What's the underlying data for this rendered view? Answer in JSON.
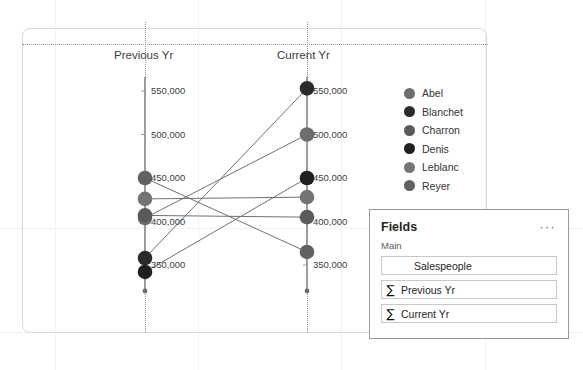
{
  "canvas": {
    "width": 583,
    "height": 370,
    "background": "#ffffff"
  },
  "visual": {
    "name": "line-chart-visual",
    "border_color": "#d9d9d9"
  },
  "chart_data": {
    "type": "line",
    "title": "",
    "xlabel": "",
    "ylabel": "",
    "categories": [
      "Previous Yr",
      "Current Yr"
    ],
    "ylim": [
      350000,
      550000
    ],
    "ytick_values": [
      350000,
      400000,
      450000,
      500000,
      550000
    ],
    "ytick_labels": [
      "350,000",
      "400,000",
      "450,000",
      "500,000",
      "550,000"
    ],
    "left_axis_tick_labels": [
      "550,000",
      "500,000",
      "450,000",
      "400,000",
      "350,000"
    ],
    "right_axis_tick_labels": [
      "550,000",
      "500,000",
      "450,000",
      "400,000",
      "350,000"
    ],
    "grid": false,
    "legend_position": "right",
    "series": [
      {
        "name": "Abel",
        "color": "#6e6e6e",
        "values": [
          404000,
          500000
        ]
      },
      {
        "name": "Blanchet",
        "color": "#2b2b2b",
        "values": [
          358000,
          553000
        ]
      },
      {
        "name": "Charron",
        "color": "#5a5a5a",
        "values": [
          407000,
          405000
        ]
      },
      {
        "name": "Denis",
        "color": "#1f1f1f",
        "values": [
          342000,
          450000
        ]
      },
      {
        "name": "Leblanc",
        "color": "#747474",
        "values": [
          426000,
          428000
        ]
      },
      {
        "name": "Reyer",
        "color": "#616161",
        "values": [
          450000,
          365000
        ]
      }
    ]
  },
  "legend": {
    "items": [
      {
        "label": "Abel",
        "color": "#6e6e6e"
      },
      {
        "label": "Blanchet",
        "color": "#2b2b2b"
      },
      {
        "label": "Charron",
        "color": "#5a5a5a"
      },
      {
        "label": "Denis",
        "color": "#1f1f1f"
      },
      {
        "label": "Leblanc",
        "color": "#747474"
      },
      {
        "label": "Reyer",
        "color": "#616161"
      }
    ]
  },
  "fields_pane": {
    "title": "Fields",
    "menu_glyph": "···",
    "section_label": "Main",
    "items": [
      {
        "name": "Salespeople",
        "aggregate": "",
        "indent": true
      },
      {
        "name": "Previous Yr",
        "aggregate": "∑",
        "indent": false
      },
      {
        "name": "Current Yr",
        "aggregate": "∑",
        "indent": false
      }
    ]
  }
}
